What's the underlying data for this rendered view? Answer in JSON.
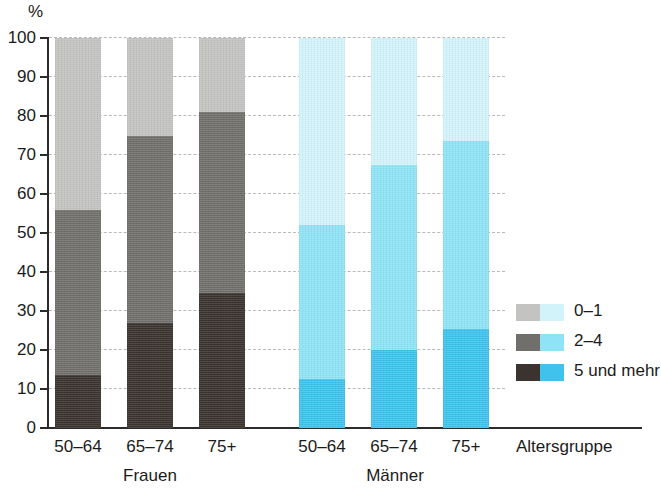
{
  "chart_data": {
    "type": "bar",
    "stacked": true,
    "title": "",
    "subtitle": "",
    "xlabel": "Altersgruppe",
    "ylabel": "%",
    "ylim": [
      0,
      100
    ],
    "ytick_labels": [
      "100",
      "90",
      "80",
      "70",
      "60",
      "50",
      "40",
      "30",
      "20",
      "10",
      "0"
    ],
    "ytick_values": [
      100,
      90,
      80,
      70,
      60,
      50,
      40,
      30,
      20,
      10,
      0
    ],
    "grid": "horizontal-dashed",
    "legend_position": "right",
    "categories": [
      "50–64",
      "65–74",
      "75+",
      "50–64",
      "65–74",
      "75+"
    ],
    "groups": [
      {
        "name": "Frauen",
        "categories": [
          "50–64",
          "65–74",
          "75+"
        ]
      },
      {
        "name": "Männer",
        "categories": [
          "50–64",
          "65–74",
          "75+"
        ]
      }
    ],
    "series": [
      {
        "name": "0–1",
        "values": [
          44.0,
          25.0,
          19.0,
          48.0,
          32.5,
          26.5
        ]
      },
      {
        "name": "2–4",
        "values": [
          42.5,
          48.0,
          46.5,
          39.5,
          47.5,
          48.0
        ]
      },
      {
        "name": "5 und mehr",
        "values": [
          13.5,
          27.0,
          34.5,
          12.5,
          20.0,
          25.5
        ]
      }
    ],
    "cumulative_tops": {
      "2–4": [
        56.0,
        75.0,
        81.0,
        52.0,
        67.5,
        74.0
      ],
      "5 und mehr": [
        13.5,
        27.0,
        34.5,
        12.5,
        20.0,
        25.5
      ]
    },
    "bars": [
      {
        "group": "Frauen",
        "category": "50–64",
        "palette": "grey",
        "segments": [
          {
            "name": "5 und mehr",
            "value": 13.5,
            "color": "#3a332f"
          },
          {
            "name": "2–4",
            "value": 42.5,
            "color": "#706f6c"
          },
          {
            "name": "0–1",
            "value": 44.0,
            "color": "#c3c3c1"
          }
        ]
      },
      {
        "group": "Frauen",
        "category": "65–74",
        "palette": "grey",
        "segments": [
          {
            "name": "5 und mehr",
            "value": 27.0,
            "color": "#3a332f"
          },
          {
            "name": "2–4",
            "value": 48.0,
            "color": "#706f6c"
          },
          {
            "name": "0–1",
            "value": 25.0,
            "color": "#c3c3c1"
          }
        ]
      },
      {
        "group": "Frauen",
        "category": "75+",
        "palette": "grey",
        "segments": [
          {
            "name": "5 und mehr",
            "value": 34.5,
            "color": "#3a332f"
          },
          {
            "name": "2–4",
            "value": 46.5,
            "color": "#706f6c"
          },
          {
            "name": "0–1",
            "value": 19.0,
            "color": "#c3c3c1"
          }
        ]
      },
      {
        "group": "Männer",
        "category": "50–64",
        "palette": "blue",
        "segments": [
          {
            "name": "5 und mehr",
            "value": 12.5,
            "color": "#3fc3ed"
          },
          {
            "name": "2–4",
            "value": 39.5,
            "color": "#8fe3f6"
          },
          {
            "name": "0–1",
            "value": 48.0,
            "color": "#d3f3fb"
          }
        ]
      },
      {
        "group": "Männer",
        "category": "65–74",
        "palette": "blue",
        "segments": [
          {
            "name": "5 und mehr",
            "value": 20.0,
            "color": "#3fc3ed"
          },
          {
            "name": "2–4",
            "value": 47.5,
            "color": "#8fe3f6"
          },
          {
            "name": "0–1",
            "value": 32.5,
            "color": "#d3f3fb"
          }
        ]
      },
      {
        "group": "Männer",
        "category": "75+",
        "palette": "blue",
        "segments": [
          {
            "name": "5 und mehr",
            "value": 25.5,
            "color": "#3fc3ed"
          },
          {
            "name": "2–4",
            "value": 48.0,
            "color": "#8fe3f6"
          },
          {
            "name": "0–1",
            "value": 26.5,
            "color": "#d3f3fb"
          }
        ]
      }
    ]
  },
  "axis": {
    "y_unit": "%",
    "x_title": "Altersgruppe",
    "ticks": [
      "100",
      "90",
      "80",
      "70",
      "60",
      "50",
      "40",
      "30",
      "20",
      "10",
      "0"
    ]
  },
  "x_labels": {
    "f1": "50–64",
    "f2": "65–74",
    "f3": "75+",
    "m1": "50–64",
    "m2": "65–74",
    "m3": "75+",
    "group_women": "Frauen",
    "group_men": "Männer"
  },
  "legend": {
    "items": [
      {
        "label": "0–1",
        "grey": "#c3c3c1",
        "blue": "#d3f3fb"
      },
      {
        "label": "2–4",
        "grey": "#706f6c",
        "blue": "#8fe3f6"
      },
      {
        "label": "5 und mehr",
        "grey": "#3a332f",
        "blue": "#3fc3ed"
      }
    ]
  },
  "colors": {
    "axis": "#2b2b2b",
    "grid": "#b9b9b9",
    "text": "#1b1b1b",
    "background": "#ffffff"
  }
}
